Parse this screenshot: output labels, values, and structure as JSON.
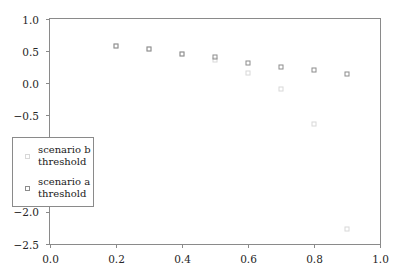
{
  "chart_data": {
    "type": "scatter",
    "title": "",
    "xlabel": "",
    "ylabel": "",
    "xlim": [
      0.0,
      1.0
    ],
    "ylim": [
      -2.5,
      1.0
    ],
    "grid": false,
    "legend_position": "lower left",
    "xticks": [
      "0.0",
      "0.2",
      "0.4",
      "0.6",
      "0.8",
      "1.0"
    ],
    "xtick_values": [
      0.0,
      0.2,
      0.4,
      0.6,
      0.8,
      1.0
    ],
    "yticks": [
      "1.0",
      "0.5",
      "0.0",
      "−0.5",
      "−1.0",
      "−1.5",
      "−2.0",
      "−2.5"
    ],
    "ytick_values": [
      1.0,
      0.5,
      0.0,
      -0.5,
      -1.0,
      -1.5,
      -2.0,
      -2.5
    ],
    "series": [
      {
        "name": "scenario a\nthreshold",
        "label_line1": "scenario a",
        "label_line2": "threshold",
        "marker": "open-square",
        "color": "#8c8c8c",
        "x": [
          0.2,
          0.3,
          0.4,
          0.5,
          0.6,
          0.7,
          0.8,
          0.9
        ],
        "y": [
          0.58,
          0.53,
          0.46,
          0.41,
          0.31,
          0.25,
          0.2,
          0.15
        ]
      },
      {
        "name": "scenario b\nthreshold",
        "label_line1": "scenario b",
        "label_line2": "threshold",
        "marker": "open-square",
        "color": "#d8d8d8",
        "x": [
          0.2,
          0.3,
          0.4,
          0.5,
          0.6,
          0.7,
          0.8,
          0.9
        ],
        "y": [
          0.58,
          0.53,
          0.46,
          0.37,
          0.16,
          -0.09,
          -0.63,
          -2.27
        ]
      }
    ]
  },
  "legend": {
    "entries": [
      {
        "label_line1": "scenario b",
        "label_line2": "threshold",
        "series": "b"
      },
      {
        "label_line1": "scenario a",
        "label_line2": "threshold",
        "series": "a"
      }
    ]
  },
  "axes": {
    "x": {
      "ticks": [
        "0.0",
        "0.2",
        "0.4",
        "0.6",
        "0.8",
        "1.0"
      ]
    },
    "y": {
      "ticks": [
        "1.0",
        "0.5",
        "0.0",
        "−0.5",
        "−1.0",
        "−1.5",
        "−2.0",
        "−2.5"
      ]
    }
  },
  "colors": {
    "frame": "#8a8a8a",
    "text": "#262626",
    "series_a": "#8c8c8c",
    "series_b": "#d8d8d8",
    "background": "#ffffff"
  }
}
